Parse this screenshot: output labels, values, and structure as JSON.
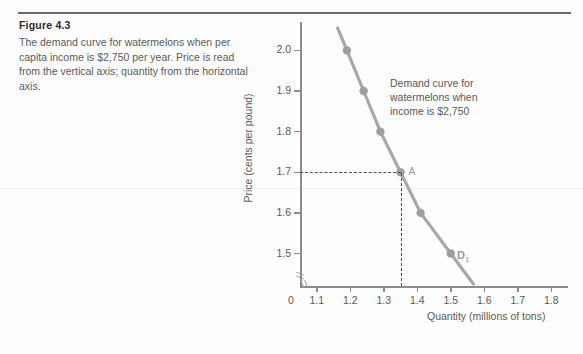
{
  "figure": {
    "title": "Figure 4.3",
    "description": "The demand curve for watermelons when per capita income is $2,750 per year. Price is read from the vertical axis; quantity from the horizontal axis."
  },
  "chart_data": {
    "type": "line",
    "title": "",
    "xlabel": "Quantity (millions of tons)",
    "ylabel": "Price (cents per pound)",
    "xlim": [
      1.05,
      1.85
    ],
    "ylim": [
      1.42,
      2.06
    ],
    "grid": false,
    "legend": "none",
    "origin_label": "0",
    "axis_break": true,
    "xticks": [
      "1.1",
      "1.2",
      "1.3",
      "1.4",
      "1.5",
      "1.6",
      "1.7",
      "1.8"
    ],
    "xtick_values": [
      1.1,
      1.2,
      1.3,
      1.4,
      1.5,
      1.6,
      1.7,
      1.8
    ],
    "yticks": [
      "1.5",
      "1.6",
      "1.7",
      "1.8",
      "1.9",
      "2.0"
    ],
    "ytick_values": [
      1.5,
      1.6,
      1.7,
      1.8,
      1.9,
      2.0
    ],
    "series": [
      {
        "name": "D1",
        "label": "D",
        "label_subscript": "1",
        "color": "#a8a8a8",
        "x": [
          1.19,
          1.24,
          1.29,
          1.35,
          1.41,
          1.5
        ],
        "y": [
          2.0,
          1.9,
          1.8,
          1.7,
          1.6,
          1.5
        ]
      }
    ],
    "annotations": [
      {
        "name": "demand-curve-note",
        "text": "Demand curve for\nwatermelons when\nincome is $2,750"
      },
      {
        "name": "point-a",
        "text": "A",
        "x": 1.35,
        "y": 1.7
      }
    ],
    "guides": [
      {
        "name": "price-guide",
        "orientation": "horizontal",
        "value": 1.7
      },
      {
        "name": "quantity-guide",
        "orientation": "vertical",
        "value": 1.35
      }
    ]
  }
}
